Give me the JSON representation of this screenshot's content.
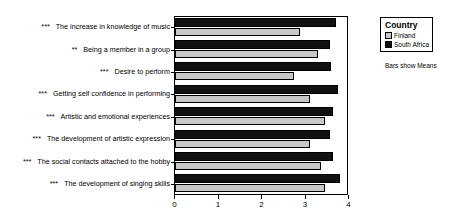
{
  "chart_data": {
    "type": "bar",
    "orientation": "horizontal",
    "title": "",
    "xlabel": "",
    "ylabel": "",
    "xlim": [
      0,
      4
    ],
    "xticks": [
      "0",
      "1",
      "2",
      "3",
      "4"
    ],
    "grid": false,
    "legend_position": "right",
    "legend_title": "Country",
    "note": "Bars show Means",
    "categories": [
      {
        "stars": "***",
        "label": "The increase in knowledge of music"
      },
      {
        "stars": "**",
        "label": "Being a member in a group"
      },
      {
        "stars": "***",
        "label": "Desire to perform"
      },
      {
        "stars": "***",
        "label": "Getting self confidence in performing"
      },
      {
        "stars": "***",
        "label": "Artistic and emotional experiences"
      },
      {
        "stars": "***",
        "label": "The development of artistic expression"
      },
      {
        "stars": "***",
        "label": "The social contacts attached to the hobby"
      },
      {
        "stars": "***",
        "label": "The development of singing skills"
      }
    ],
    "series": [
      {
        "name": "South Africa",
        "color": "#111111",
        "values": [
          3.7,
          3.56,
          3.59,
          3.75,
          3.63,
          3.56,
          3.63,
          3.79
        ]
      },
      {
        "name": "Finland",
        "color": "#c8c8c8",
        "values": [
          2.87,
          3.29,
          2.74,
          3.1,
          3.45,
          3.1,
          3.36,
          3.45
        ]
      }
    ]
  },
  "legend": {
    "title": "Country",
    "items": [
      {
        "label": "Finland",
        "color": "#c8c8c8"
      },
      {
        "label": "South Africa",
        "color": "#111111"
      }
    ]
  },
  "note": "Bars show Means"
}
